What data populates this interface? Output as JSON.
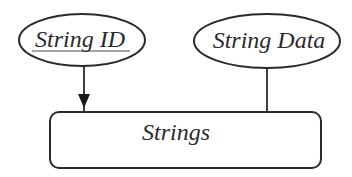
{
  "diagram": {
    "type": "entity-relationship",
    "entity": {
      "name": "Strings",
      "shape": "rounded-rectangle"
    },
    "attributes": [
      {
        "name": "String ID",
        "shape": "ellipse",
        "is_key": true,
        "connector": "arrow"
      },
      {
        "name": "String Data",
        "shape": "ellipse",
        "is_key": false,
        "connector": "line"
      }
    ],
    "colors": {
      "stroke": "#2a2a2a",
      "text": "#2a2a2a",
      "background": "#ffffff"
    }
  }
}
